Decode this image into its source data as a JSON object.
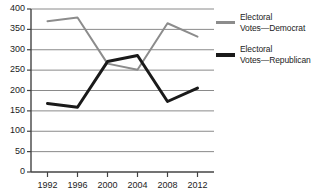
{
  "chart_data": {
    "type": "line",
    "title": "",
    "xlabel": "",
    "ylabel": "",
    "categories": [
      "1992",
      "1996",
      "2000",
      "2004",
      "2008",
      "2012"
    ],
    "x": [
      1992,
      1996,
      2000,
      2004,
      2008,
      2012
    ],
    "ylim": [
      0,
      400
    ],
    "yticks": [
      0,
      50,
      100,
      150,
      200,
      250,
      300,
      350,
      400
    ],
    "ytick_labels": [
      "0",
      "50",
      "100",
      "150",
      "200",
      "250",
      "300",
      "350",
      "400"
    ],
    "grid": true,
    "grid_axis": "y",
    "legend_position": "right",
    "series": [
      {
        "name": "Electoral Votes—Democrat",
        "name_line1": "Electoral",
        "name_line2": "Votes—Democrat",
        "color": "#8c8c8c",
        "width": 2,
        "values": [
          370,
          379,
          266,
          251,
          365,
          332
        ]
      },
      {
        "name": "Electoral Votes—Republican",
        "name_line1": "Electoral",
        "name_line2": "Votes—Republican",
        "color": "#1a1a1a",
        "width": 3,
        "values": [
          168,
          159,
          271,
          286,
          173,
          206
        ]
      }
    ]
  },
  "axis": {
    "line_color": "#444444",
    "grid_color": "#8a8a8a",
    "text_color": "#1c1c1c"
  },
  "legend": {
    "items": [
      {
        "line1": "Electoral",
        "line2": "Votes—Democrat",
        "color": "#8c8c8c"
      },
      {
        "line1": "Electoral",
        "line2": "Votes—Republican",
        "color": "#1a1a1a"
      }
    ]
  }
}
